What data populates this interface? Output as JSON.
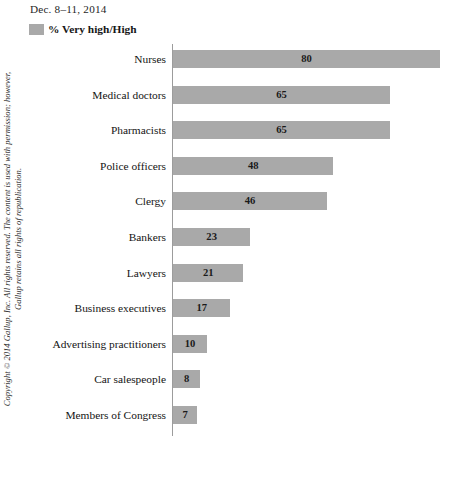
{
  "header": {
    "date_label": "Dec. 8–11, 2014",
    "legend_label": "% Very high/High",
    "legend_swatch_name": "legend-color-swatch"
  },
  "copyright": {
    "line1": "Copyright © 2014 Gallup, Inc. All rights reserved. The content is used with permission; however,",
    "line2": "Gallup retains all rights of republication."
  },
  "colors": {
    "bar": "#a9a9a9",
    "axis": "#9c9c9c",
    "background": "#ffffff",
    "text": "#1a1a1a"
  },
  "chart_data": {
    "type": "bar",
    "orientation": "horizontal",
    "title": "",
    "subtitle": "Dec. 8–11, 2014",
    "xlabel": "",
    "ylabel": "",
    "legend": [
      "% Very high/High"
    ],
    "legend_position": "top-left",
    "grid": false,
    "xlim": [
      0,
      87
    ],
    "categories": [
      "Nurses",
      "Medical doctors",
      "Pharmacists",
      "Police officers",
      "Clergy",
      "Bankers",
      "Lawyers",
      "Business executives",
      "Advertising practitioners",
      "Car salespeople",
      "Members of Congress"
    ],
    "values": [
      80,
      65,
      65,
      48,
      46,
      23,
      21,
      17,
      10,
      8,
      7
    ],
    "series": [
      {
        "name": "% Very high/High",
        "values": [
          80,
          65,
          65,
          48,
          46,
          23,
          21,
          17,
          10,
          8,
          7
        ]
      }
    ]
  }
}
